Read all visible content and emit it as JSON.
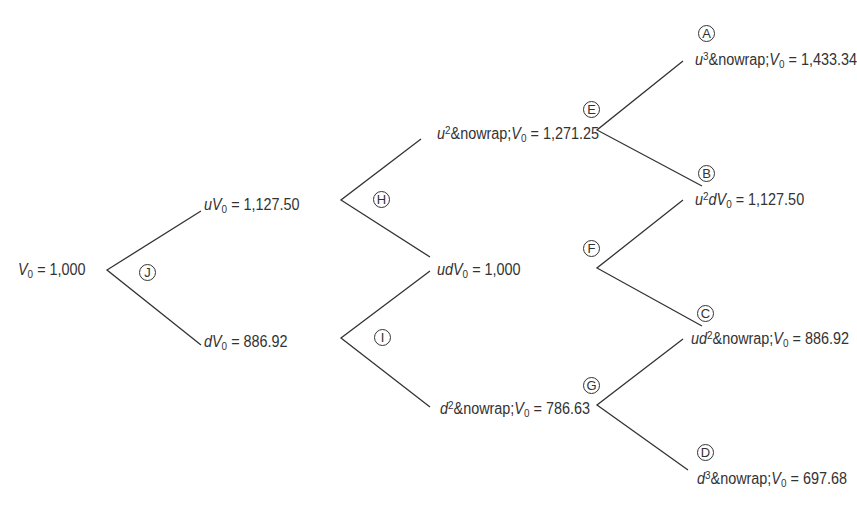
{
  "diagram": {
    "type": "binomial-tree",
    "periods": 3,
    "line_color": "#333333",
    "text_color": "#333333",
    "nodes": {
      "root": {
        "prefix": "",
        "power": "",
        "suffix": "",
        "value": "1,000"
      },
      "u": {
        "prefix": "u",
        "power": "",
        "suffix": "",
        "value": "1,127.50"
      },
      "d": {
        "prefix": "d",
        "power": "",
        "suffix": "",
        "value": "886.92"
      },
      "uu": {
        "prefix": "u",
        "power": "2",
        "suffix": "",
        "value": "1,271.25"
      },
      "ud": {
        "prefix": "ud",
        "power": "",
        "suffix": "",
        "value": "1,000"
      },
      "dd": {
        "prefix": "d",
        "power": "2",
        "suffix": "",
        "value": "786.63"
      },
      "uuu": {
        "prefix": "u",
        "power": "3",
        "suffix": "",
        "value": "1,433.34"
      },
      "uud": {
        "prefix": "u",
        "power": "2",
        "suffix": "d",
        "value": "1,127.50"
      },
      "udd": {
        "prefix": "ud",
        "power": "2",
        "suffix": "",
        "value": "886.92"
      },
      "ddd": {
        "prefix": "d",
        "power": "3",
        "suffix": "",
        "value": "697.68"
      }
    },
    "variable": "V",
    "subscript": "0",
    "equals": "=",
    "markers": {
      "A": "A",
      "B": "B",
      "C": "C",
      "D": "D",
      "E": "E",
      "F": "F",
      "G": "G",
      "H": "H",
      "I": "I",
      "J": "J"
    }
  }
}
